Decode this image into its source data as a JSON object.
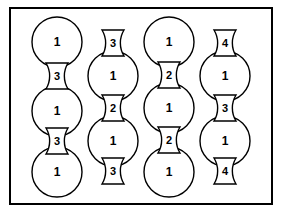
{
  "figure": {
    "background_color": "#ffffff",
    "stroke_color": "#000000",
    "fill_color": "#ffffff",
    "frame": {
      "x": 9,
      "y": 7,
      "width": 264,
      "height": 198,
      "border_width": 2,
      "border_color": "#000000"
    },
    "geometry": {
      "circle_radius": 25,
      "column_x": [
        57,
        113,
        169,
        225
      ],
      "row_pitch": 45,
      "lens_half_width": 11
    },
    "columns": [
      {
        "name": "column-1",
        "center_x": 57,
        "starts_with": "circle",
        "circles": [
          {
            "label": "1",
            "cy": 42
          },
          {
            "label": "1",
            "cy": 111
          },
          {
            "label": "1",
            "cy": 172
          }
        ],
        "connectors": [
          {
            "label": "3",
            "cy": 76
          },
          {
            "label": "3",
            "cy": 141
          }
        ]
      },
      {
        "name": "column-2",
        "center_x": 113,
        "starts_with": "connector",
        "circles": [
          {
            "label": "1",
            "cy": 76
          },
          {
            "label": "1",
            "cy": 141
          }
        ],
        "connectors": [
          {
            "label": "3",
            "cy": 43
          },
          {
            "label": "2",
            "cy": 108
          },
          {
            "label": "3",
            "cy": 171
          }
        ]
      },
      {
        "name": "column-3",
        "center_x": 169,
        "starts_with": "circle",
        "circles": [
          {
            "label": "1",
            "cy": 42
          },
          {
            "label": "1",
            "cy": 108
          },
          {
            "label": "1",
            "cy": 172
          }
        ],
        "connectors": [
          {
            "label": "2",
            "cy": 75
          },
          {
            "label": "2",
            "cy": 140
          }
        ]
      },
      {
        "name": "column-4",
        "center_x": 225,
        "starts_with": "connector",
        "circles": [
          {
            "label": "1",
            "cy": 76
          },
          {
            "label": "1",
            "cy": 141
          }
        ],
        "connectors": [
          {
            "label": "4",
            "cy": 43
          },
          {
            "label": "3",
            "cy": 108
          },
          {
            "label": "4",
            "cy": 171
          }
        ]
      }
    ]
  }
}
